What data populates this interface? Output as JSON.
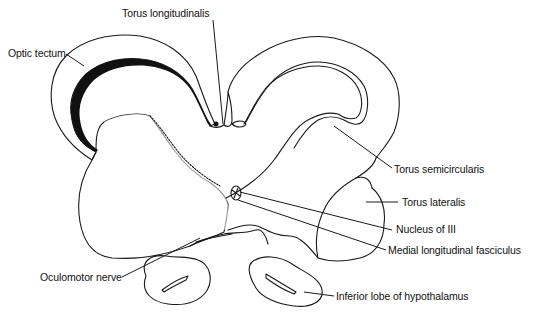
{
  "figure": {
    "labels": [
      {
        "id": "torus-longitudinalis",
        "text": "Torus longitudinalis",
        "x": 204,
        "y": 18
      },
      {
        "id": "optic-tectum",
        "text": "Optic tectum",
        "x": 8,
        "y": 57
      },
      {
        "id": "torus-semicircularis",
        "text": "Torus semicircularis",
        "x": 395,
        "y": 173
      },
      {
        "id": "torus-lateralis",
        "text": "Torus lateralis",
        "x": 402,
        "y": 206
      },
      {
        "id": "nucleus-of-iii",
        "text": "Nucleus of III",
        "x": 396,
        "y": 233
      },
      {
        "id": "medial-longitudinal-fasciculus",
        "text": "Medial longitudinal fasciculus",
        "x": 388,
        "y": 254
      },
      {
        "id": "oculomotor-nerve",
        "text": "Oculomotor nerve",
        "x": 40,
        "y": 281
      },
      {
        "id": "inferior-lobe-of-hypothalamus",
        "text": "Inferior lobe of hypothalamus",
        "x": 336,
        "y": 300
      }
    ]
  },
  "colors": {
    "line": "#1a1a1a",
    "background": "#ffffff",
    "text": "#111111"
  }
}
